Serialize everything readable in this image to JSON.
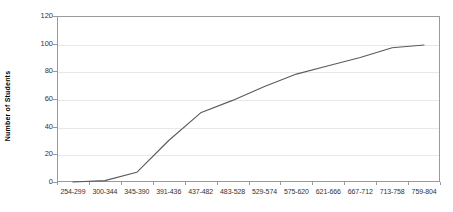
{
  "chart_data": {
    "type": "line",
    "title": "",
    "subtitle": "",
    "xlabel": "",
    "ylabel": "Number of Students",
    "categories": [
      "254-299",
      "300-344",
      "345-390",
      "391-436",
      "437-482",
      "483-528",
      "529-574",
      "575-620",
      "621-666",
      "667-712",
      "713-758",
      "759-804"
    ],
    "values": [
      0,
      1,
      7,
      30,
      50,
      59,
      69,
      78,
      84,
      90,
      97,
      99
    ],
    "series": [
      {
        "name": "Cumulative number of students",
        "values": [
          0,
          1,
          7,
          30,
          50,
          59,
          69,
          78,
          84,
          90,
          97,
          99
        ]
      }
    ],
    "ylim": [
      0,
      120
    ],
    "y_ticks": [
      0,
      20,
      40,
      60,
      80,
      100,
      120
    ],
    "y_tick_labels": [
      "0",
      "20",
      "40",
      "60",
      "80",
      "100",
      "120"
    ],
    "grid": true,
    "grid_axis": "y",
    "legend": false,
    "legend_position": "none",
    "markers": false,
    "line_color": "#5a5a5a",
    "grid_color": "#e8e8e8",
    "frame_color": "#9a9a9a",
    "text_color": "#333333",
    "background_color": "#ffffff"
  }
}
